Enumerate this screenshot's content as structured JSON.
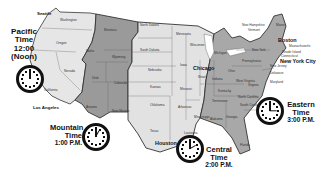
{
  "map": {
    "title": "U.S. Time Zones",
    "colors": {
      "pacific": "#e6e6e6",
      "mountain": "#9a9a9a",
      "central": "#dedede",
      "eastern": "#a8a8a8",
      "border": "#333333"
    }
  },
  "zones": [
    {
      "name": "Pacific",
      "line1": "Pacific",
      "line2": "Time",
      "line3": "12:00",
      "line4": "(Noon)",
      "hour": 12
    },
    {
      "name": "Mountain",
      "line1": "Mountain",
      "line2": "Time",
      "line3": "1:00 P.M.",
      "hour": 1
    },
    {
      "name": "Central",
      "line1": "Central",
      "line2": "Time",
      "line3": "2:00 P.M.",
      "hour": 2
    },
    {
      "name": "Eastern",
      "line1": "Eastern",
      "line2": "Time",
      "line3": "3:00 P.M.",
      "hour": 3
    }
  ],
  "cities": {
    "seattle": "Seattle",
    "los_angeles": "Los Angeles",
    "chicago": "Chicago",
    "houston": "Houston",
    "boston": "Boston",
    "new_york": "New York City"
  },
  "states": {
    "washington": "Washington",
    "oregon": "Oregon",
    "california": "California",
    "nevada": "Nevada",
    "idaho": "Idaho",
    "montana": "Montana",
    "wyoming": "Wyoming",
    "utah": "Utah",
    "colorado": "Colorado",
    "arizona": "Arizona",
    "new_mexico": "New Mexico",
    "north_dakota": "North Dakota",
    "south_dakota": "South Dakota",
    "nebraska": "Nebraska",
    "kansas": "Kansas",
    "oklahoma": "Oklahoma",
    "texas": "Texas",
    "minnesota": "Minnesota",
    "iowa": "Iowa",
    "missouri": "Missouri",
    "arkansas": "Arkansas",
    "louisiana": "Louisiana",
    "wisconsin": "Wisconsin",
    "illinois": "Illinois",
    "michigan": "Michigan",
    "indiana": "Indiana",
    "ohio": "Ohio",
    "kentucky": "Kentucky",
    "tennessee": "Tennessee",
    "mississippi": "Mississippi",
    "alabama": "Alabama",
    "georgia": "Georgia",
    "florida": "Florida",
    "south_carolina": "South Carolina",
    "north_carolina": "North Carolina",
    "virginia": "Virginia",
    "west_virginia": "West Virginia",
    "pennsylvania": "Pennsylvania",
    "new_york": "New York",
    "maine": "Maine",
    "new_hampshire": "New Hampshire",
    "vermont": "Vermont",
    "massachusetts": "Massachusetts",
    "rhode_island": "Rhode Island",
    "connecticut": "Connecticut",
    "new_jersey": "New Jersey",
    "delaware": "Delaware",
    "maryland": "Maryland"
  }
}
